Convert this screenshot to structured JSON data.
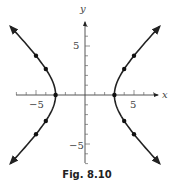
{
  "caption": "Fig. 8.10",
  "chart_data": {
    "type": "line",
    "title": "",
    "equation": "x^2 - y^2 = 9",
    "xlabel": "x",
    "ylabel": "y",
    "xlim": [
      -7.5,
      7.5
    ],
    "ylim": [
      -7,
      7
    ],
    "grid": false,
    "legend": null,
    "x_ticks": [
      -7,
      -6,
      -5,
      -4,
      -3,
      -2,
      -1,
      1,
      2,
      3,
      4,
      5,
      6,
      7
    ],
    "x_tick_labels": [
      "-5",
      "5"
    ],
    "y_ticks": [
      -7,
      -6,
      -5,
      -4,
      -3,
      -2,
      -1,
      1,
      2,
      3,
      4,
      5,
      6,
      7
    ],
    "y_tick_labels": [
      "5",
      "-5"
    ],
    "series": [
      {
        "name": "right branch",
        "points": [
          [
            3,
            0
          ],
          [
            4,
            2.65
          ],
          [
            5,
            4
          ],
          [
            4,
            -2.65
          ],
          [
            5,
            -4
          ]
        ],
        "arrows": "both ends"
      },
      {
        "name": "left branch",
        "points": [
          [
            -3,
            0
          ],
          [
            -4,
            2.65
          ],
          [
            -5,
            4
          ],
          [
            -4,
            -2.65
          ],
          [
            -5,
            -4
          ]
        ],
        "arrows": "both ends"
      }
    ]
  },
  "labels": {
    "x_axis": "x",
    "y_axis": "y",
    "tick_neg5_x": "−5",
    "tick_pos5_x": "5",
    "tick_pos5_y": "5",
    "tick_neg5_y": "−5"
  }
}
